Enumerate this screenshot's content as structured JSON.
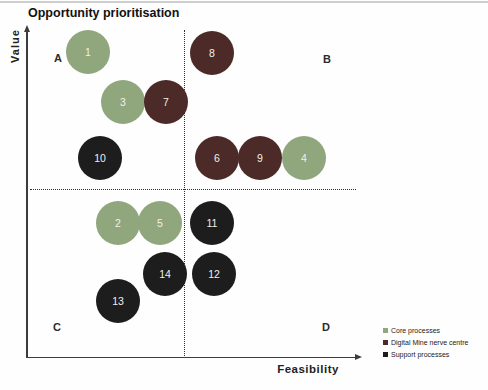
{
  "title": "Opportunity prioritisation",
  "axes": {
    "y_label": "Value",
    "x_label": "Feasibility"
  },
  "quadrants": {
    "top_left": "A",
    "top_right": "B",
    "bottom_left": "C",
    "bottom_right": "D"
  },
  "colors": {
    "Core processes": "#90a67c",
    "Digital Mine nerve centre": "#4c2a27",
    "Support processes": "#1d1d1d",
    "bubble_number_text": "#f2efe9",
    "axis": "#3c3c3c",
    "divider_dotted": "#2e2e2e"
  },
  "legend": [
    {
      "label": "Core processes",
      "color": "#90a67c"
    },
    {
      "label": "Digital Mine nerve centre",
      "color": "#4c2a27"
    },
    {
      "label": "Support processes",
      "color": "#1d1d1d"
    }
  ],
  "chart_data": {
    "type": "scatter",
    "title": "Opportunity prioritisation",
    "xlabel": "Feasibility",
    "ylabel": "Value",
    "xlim": [
      0,
      100
    ],
    "ylim": [
      0,
      100
    ],
    "grid": false,
    "legend_position": "bottom-right",
    "axis_style": "arrows, no numeric ticks (qualitative 2x2 priority matrix)",
    "quadrant_thresholds": {
      "feasibility": 48,
      "value": 51
    },
    "quadrant_labels": {
      "top_left": "A",
      "top_right": "B",
      "bottom_left": "C",
      "bottom_right": "D"
    },
    "series_legend": [
      "Core processes",
      "Digital Mine nerve centre",
      "Support processes"
    ],
    "points": [
      {
        "id": 1,
        "category": "Core processes",
        "feasibility": 18,
        "value": 93,
        "quadrant": "A",
        "px": [
          88,
          52
        ]
      },
      {
        "id": 2,
        "category": "Core processes",
        "feasibility": 27,
        "value": 41,
        "quadrant": "C",
        "px": [
          118,
          223
        ]
      },
      {
        "id": 3,
        "category": "Core processes",
        "feasibility": 29,
        "value": 78,
        "quadrant": "A",
        "px": [
          123,
          102
        ]
      },
      {
        "id": 4,
        "category": "Core processes",
        "feasibility": 84,
        "value": 61,
        "quadrant": "B",
        "px": [
          304,
          158
        ]
      },
      {
        "id": 5,
        "category": "Core processes",
        "feasibility": 40,
        "value": 41,
        "quadrant": "C",
        "px": [
          160,
          223
        ]
      },
      {
        "id": 6,
        "category": "Digital Mine nerve centre",
        "feasibility": 57,
        "value": 61,
        "quadrant": "B",
        "px": [
          217,
          158
        ]
      },
      {
        "id": 7,
        "category": "Digital Mine nerve centre",
        "feasibility": 42,
        "value": 78,
        "quadrant": "A",
        "px": [
          166,
          102
        ]
      },
      {
        "id": 8,
        "category": "Digital Mine nerve centre",
        "feasibility": 56,
        "value": 93,
        "quadrant": "B",
        "px": [
          212,
          53
        ]
      },
      {
        "id": 9,
        "category": "Digital Mine nerve centre",
        "feasibility": 70,
        "value": 61,
        "quadrant": "B",
        "px": [
          260,
          158
        ]
      },
      {
        "id": 10,
        "category": "Support processes",
        "feasibility": 22,
        "value": 61,
        "quadrant": "A",
        "px": [
          100,
          158
        ]
      },
      {
        "id": 11,
        "category": "Support processes",
        "feasibility": 56,
        "value": 41,
        "quadrant": "D",
        "px": [
          212,
          223
        ]
      },
      {
        "id": 12,
        "category": "Support processes",
        "feasibility": 57,
        "value": 26,
        "quadrant": "D",
        "px": [
          214,
          274
        ]
      },
      {
        "id": 13,
        "category": "Support processes",
        "feasibility": 27,
        "value": 17,
        "quadrant": "C",
        "px": [
          118,
          301
        ]
      },
      {
        "id": 14,
        "category": "Support processes",
        "feasibility": 42,
        "value": 26,
        "quadrant": "C",
        "px": [
          165,
          274
        ]
      }
    ]
  }
}
